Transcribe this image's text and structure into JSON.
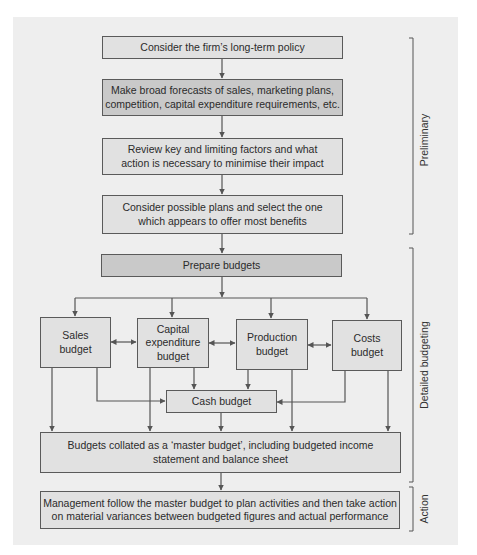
{
  "diagram": {
    "colors": {
      "panel_bg": "#eeeeee",
      "box_light": "#e1e1e1",
      "box_dark": "#c9c9c9",
      "border": "#5a5a5a",
      "line": "#555555"
    },
    "steps": {
      "policy": "Consider the firm’s long-term policy",
      "forecasts": "Make broad forecasts of sales, marketing plans,\ncompetition, capital expenditure requirements, etc.",
      "factors": "Review key and limiting factors and what\naction is necessary to minimise their impact",
      "plans": "Consider possible plans and select the one\nwhich appears to offer most benefits",
      "prepare": "Prepare budgets",
      "sales": "Sales\nbudget",
      "capital": "Capital\nexpenditure\nbudget",
      "production": "Production\nbudget",
      "costs": "Costs\nbudget",
      "cash": "Cash budget",
      "master": "Budgets collated as a ‘master budget’, including budgeted income\nstatement and balance sheet",
      "action": "Management follow the master budget to plan activities and then take action\non material variances between budgeted figures and actual performance"
    },
    "phases": {
      "preliminary": "Preliminary",
      "detailed": "Detailed budgeting",
      "action": "Action"
    },
    "connections": [
      [
        "policy",
        "forecasts"
      ],
      [
        "forecasts",
        "factors"
      ],
      [
        "factors",
        "plans"
      ],
      [
        "plans",
        "prepare"
      ],
      [
        "prepare",
        "sales"
      ],
      [
        "prepare",
        "capital"
      ],
      [
        "prepare",
        "production"
      ],
      [
        "prepare",
        "costs"
      ],
      [
        "sales",
        "capital",
        "bidirectional"
      ],
      [
        "capital",
        "production",
        "bidirectional"
      ],
      [
        "production",
        "costs",
        "bidirectional"
      ],
      [
        "sales",
        "cash"
      ],
      [
        "capital",
        "cash"
      ],
      [
        "production",
        "cash"
      ],
      [
        "costs",
        "cash"
      ],
      [
        "sales",
        "master"
      ],
      [
        "capital",
        "master"
      ],
      [
        "production",
        "master"
      ],
      [
        "costs",
        "master"
      ],
      [
        "cash",
        "master"
      ],
      [
        "master",
        "action"
      ]
    ]
  }
}
